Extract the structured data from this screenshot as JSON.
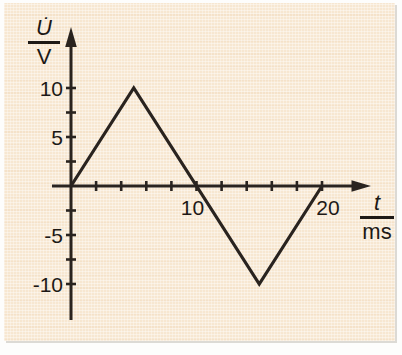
{
  "figure": {
    "background_color": "#f7e7d1",
    "line_color": "#29231f",
    "text_color": "#1d1916"
  },
  "chart_data": {
    "type": "line",
    "title": "",
    "series": [
      {
        "name": "triangle-wave",
        "points": [
          {
            "t": 0,
            "u": 0
          },
          {
            "t": 5,
            "u": 10
          },
          {
            "t": 15,
            "u": -10
          },
          {
            "t": 20,
            "u": 0
          }
        ]
      }
    ],
    "x_axis": {
      "label_numerator": "t",
      "label_denominator": "ms",
      "ticks": [
        2,
        4,
        6,
        8,
        10,
        12,
        14,
        16,
        18,
        20
      ],
      "labeled_ticks": [
        10,
        20
      ],
      "range": [
        0,
        22
      ],
      "unit": "ms"
    },
    "y_axis": {
      "label_numerator": "U̇",
      "label_denominator": "V",
      "ticks": [
        -10,
        -7.5,
        -5,
        -2.5,
        2.5,
        5,
        7.5,
        10
      ],
      "labeled_ticks": [
        -10,
        -5,
        5,
        10
      ],
      "range": [
        -12.5,
        12.5
      ],
      "unit": "V"
    },
    "grid": false,
    "legend": false
  }
}
